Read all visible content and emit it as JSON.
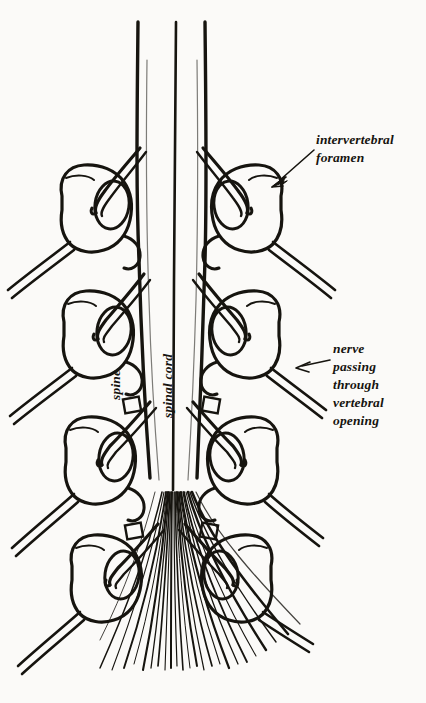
{
  "figure": {
    "background_color": "#fbfaf8",
    "ink_color": "#16140f",
    "width": 426,
    "height": 703
  },
  "labels": {
    "intervertebral_foramen": "intervertebral\nforamen",
    "nerve_passing": "nerve\npassing\nthrough\nvertebral\nopening",
    "spine": "spine",
    "spinal_cord": "spinal cord"
  },
  "annotations": [
    {
      "name": "arrow-to-intervertebral-foramen",
      "label": "intervertebral foramen",
      "from": [
        316,
        148
      ],
      "to": [
        272,
        183
      ],
      "direction": "down-left"
    },
    {
      "name": "arrow-to-nerve-opening",
      "label": "nerve passing through vertebral opening",
      "from": [
        330,
        362
      ],
      "to": [
        296,
        368
      ],
      "direction": "left"
    }
  ],
  "structures": {
    "spinal_cord": {
      "left_edge_x": 138,
      "right_edge_x": 205,
      "center_line_x": 174,
      "top_y": 22,
      "taper_end_y": 492
    },
    "cauda_equina": {
      "origin_y": 492,
      "bottom_y": 672,
      "left_spread_x": 96,
      "right_spread_x": 302,
      "filament_count": 23
    },
    "vertebrae_left": [
      {
        "cy": 205,
        "cx": 88
      },
      {
        "cy": 330,
        "cx": 90
      },
      {
        "cy": 456,
        "cx": 92
      },
      {
        "cy": 573,
        "cx": 98
      }
    ],
    "vertebrae_right": [
      {
        "cy": 205,
        "cx": 255
      },
      {
        "cy": 330,
        "cx": 253
      },
      {
        "cy": 456,
        "cx": 251
      },
      {
        "cy": 573,
        "cx": 245
      }
    ]
  }
}
